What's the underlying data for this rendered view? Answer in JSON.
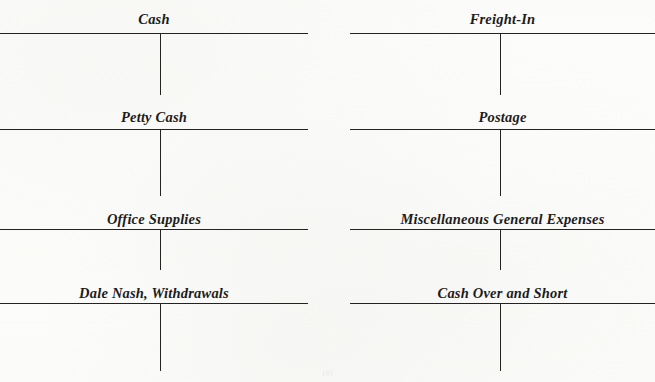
{
  "document": {
    "kind": "t-account-worksheet",
    "ink_color": "#23231f",
    "paper_color": "#fdfdfc",
    "page_number": "181"
  },
  "layout": {
    "columns": 2,
    "rows": 4
  },
  "accounts": [
    {
      "id": "cash",
      "title": "Cash",
      "column": "left",
      "row": 1
    },
    {
      "id": "freight-in",
      "title": "Freight-In",
      "column": "right",
      "row": 1
    },
    {
      "id": "petty-cash",
      "title": "Petty Cash",
      "column": "left",
      "row": 2
    },
    {
      "id": "postage",
      "title": "Postage",
      "column": "right",
      "row": 2
    },
    {
      "id": "office-supplies",
      "title": "Office Supplies",
      "column": "left",
      "row": 3
    },
    {
      "id": "misc-general",
      "title": "Miscellaneous General Expenses",
      "column": "right",
      "row": 3
    },
    {
      "id": "withdrawals",
      "title": "Dale Nash, Withdrawals",
      "column": "left",
      "row": 4
    },
    {
      "id": "cash-over-short",
      "title": "Cash Over and Short",
      "column": "right",
      "row": 4
    }
  ]
}
